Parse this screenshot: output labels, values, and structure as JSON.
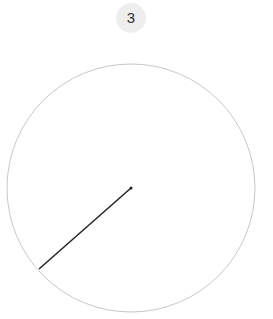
{
  "counter": {
    "value": "3"
  },
  "dial": {
    "center": {
      "x": 131,
      "y": 188
    },
    "radius": 124,
    "hand_end": {
      "x": 39,
      "y": 269
    },
    "circle_color": "#c8c8c8",
    "hand_color": "#222222"
  }
}
